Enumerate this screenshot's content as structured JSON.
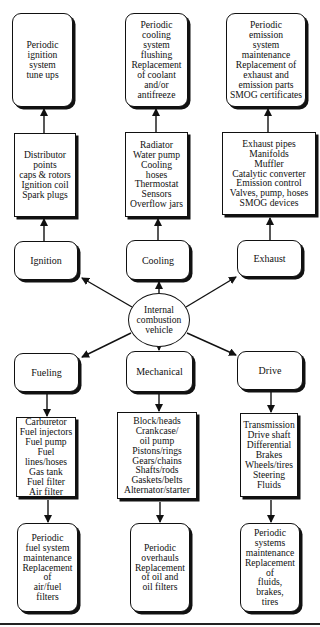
{
  "diagram": {
    "hub": {
      "lines": [
        "Internal",
        "combustion",
        "vehicle"
      ]
    },
    "systems": [
      {
        "id": "ignition",
        "category": "Ignition",
        "components": [
          "Distributor",
          "points",
          "caps & rotors",
          "Ignition coil",
          "Spark plugs"
        ],
        "maintenance": [
          "Periodic",
          "ignition",
          "system",
          "tune ups"
        ]
      },
      {
        "id": "cooling",
        "category": "Cooling",
        "components": [
          "Radiator",
          "Water pump",
          "Cooling",
          "hoses",
          "Thermostat",
          "Sensors",
          "Overflow jars"
        ],
        "maintenance": [
          "Periodic",
          "cooling",
          "system",
          "flushing",
          "Replacement",
          "of coolant",
          "and/or",
          "antifreeze"
        ]
      },
      {
        "id": "exhaust",
        "category": "Exhaust",
        "components": [
          "Exhaust pipes",
          "Manifolds",
          "Muffler",
          "Catalytic converter",
          "Emission control",
          "Valves, pump, hoses",
          "SMOG devices"
        ],
        "maintenance": [
          "Periodic",
          "emission",
          "system",
          "maintenance",
          "Replacement of",
          "exhaust and",
          "emission parts",
          "SMOG certificates"
        ]
      },
      {
        "id": "fueling",
        "category": "Fueling",
        "components": [
          "Carburetor",
          "Fuel injectors",
          "Fuel pump",
          "Fuel",
          "lines/hoses",
          "Gas tank",
          "Fuel filter",
          "Air filter"
        ],
        "maintenance": [
          "Periodic",
          "fuel system",
          "maintenance",
          "Replacement",
          "of",
          "air/fuel",
          "filters"
        ]
      },
      {
        "id": "mechanical",
        "category": "Mechanical",
        "components": [
          "Block/heads",
          "Crankcase/",
          "oil pump",
          "Pistons/rings",
          "Gears/chains",
          "Shafts/rods",
          "Gaskets/belts",
          "Alternator/starter"
        ],
        "maintenance": [
          "Periodic",
          "overhauls",
          "Replacement",
          "of oil and",
          "oil filters"
        ]
      },
      {
        "id": "drive",
        "category": "Drive",
        "components": [
          "Transmission",
          "Drive shaft",
          "Differential",
          "Brakes",
          "Wheels/tires",
          "Steering",
          "Fluids"
        ],
        "maintenance": [
          "Periodic",
          "systems",
          "maintenance",
          "Replacement",
          "of",
          "fluids,",
          "brakes,",
          "tires"
        ]
      }
    ],
    "colors": {
      "stroke": "#111111",
      "background": "#ffffff"
    }
  }
}
